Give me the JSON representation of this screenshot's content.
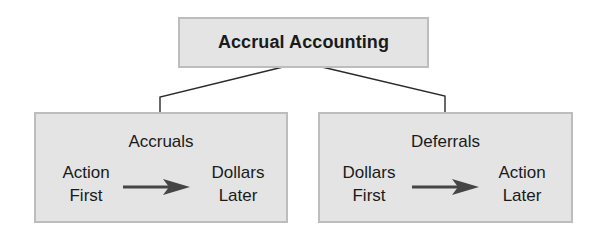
{
  "diagram": {
    "title": "Accrual Accounting",
    "branches": [
      {
        "heading": "Accruals",
        "from": [
          "Action",
          "First"
        ],
        "to": [
          "Dollars",
          "Later"
        ]
      },
      {
        "heading": "Deferrals",
        "from": [
          "Dollars",
          "First"
        ],
        "to": [
          "Action",
          "Later"
        ]
      }
    ]
  },
  "colors": {
    "box_fill": "#e4e4e4",
    "box_border": "#bdbdbd",
    "text": "#1a1a1a",
    "arrow": "#454545",
    "connector": "#2a2a2a"
  }
}
